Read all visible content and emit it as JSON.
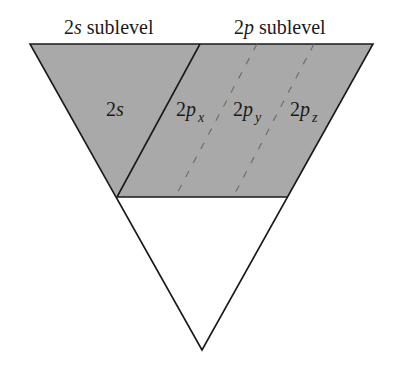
{
  "diagram": {
    "type": "orbital-energy-level-funnel",
    "colors": {
      "background": "#ffffff",
      "filled_region": "#a9a9a9",
      "outline": "#1a1a1a",
      "dashed_lines": "#6e6e6e",
      "text": "#1a1a1a"
    },
    "headers": {
      "s_sublevel": {
        "prefix": "2",
        "italic": "s",
        "suffix": " sublevel"
      },
      "p_sublevel": {
        "prefix": "2",
        "italic": "p",
        "suffix": " sublevel"
      }
    },
    "orbitals": [
      {
        "id": "2s",
        "prefix": "2",
        "italic": "s",
        "subscript": ""
      },
      {
        "id": "2px",
        "prefix": "2",
        "italic": "p",
        "subscript": "x"
      },
      {
        "id": "2py",
        "prefix": "2",
        "italic": "p",
        "subscript": "y"
      },
      {
        "id": "2pz",
        "prefix": "2",
        "italic": "p",
        "subscript": "z"
      }
    ],
    "geometry": {
      "triangle": {
        "top_left": [
          30,
          44
        ],
        "top_right": [
          373,
          44
        ],
        "bottom": [
          202,
          350
        ]
      },
      "fill_boundary_y": 197,
      "solid_divider": {
        "top": [
          200,
          44
        ],
        "bottom": [
          117,
          197
        ]
      },
      "dashed_dividers": [
        {
          "top": [
            257,
            44
          ],
          "bottom": [
            175,
            197
          ]
        },
        {
          "top": [
            314,
            44
          ],
          "bottom": [
            233,
            197
          ]
        }
      ]
    }
  }
}
